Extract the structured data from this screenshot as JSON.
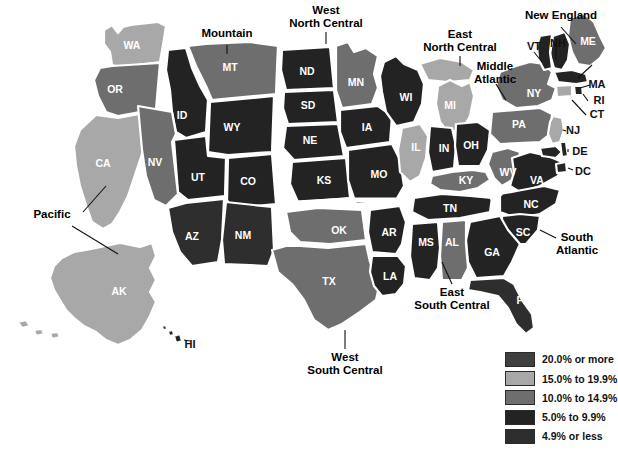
{
  "map": {
    "title": "United States Choropleth Map",
    "background_color": "#ffffff",
    "border_color": "#ffffff"
  },
  "legend": {
    "items": [
      {
        "label": "20.0% or more",
        "color": "#3f3f3f"
      },
      {
        "label": "15.0% to 19.9%",
        "color": "#a8a8a8"
      },
      {
        "label": "10.0% to 14.9%",
        "color": "#6e6e6e"
      },
      {
        "label": "5.0% to 9.9%",
        "color": "#232323"
      },
      {
        "label": "4.9% or less",
        "color": "#2e2e2e"
      }
    ]
  },
  "palette": {
    "c20plus": "#3f3f3f",
    "c15to19": "#a8a8a8",
    "c10to14": "#6e6e6e",
    "c5to9": "#232323",
    "c4orless": "#2e2e2e"
  },
  "region_labels": [
    {
      "id": "pacific",
      "lines": [
        "Pacific"
      ],
      "x": 52,
      "y": 218
    },
    {
      "id": "mountain",
      "lines": [
        "Mountain"
      ],
      "x": 227,
      "y": 37
    },
    {
      "id": "west-north-central",
      "lines": [
        "West",
        "North Central"
      ],
      "x": 326,
      "y": 14
    },
    {
      "id": "east-north-central",
      "lines": [
        "East",
        "North Central"
      ],
      "x": 460,
      "y": 38
    },
    {
      "id": "middle-atlantic",
      "lines": [
        "Middle",
        "Atlantic"
      ],
      "x": 495,
      "y": 70
    },
    {
      "id": "new-england",
      "lines": [
        "New England"
      ],
      "x": 561,
      "y": 19
    },
    {
      "id": "south-atlantic",
      "lines": [
        "South",
        "Atlantic"
      ],
      "x": 577,
      "y": 241
    },
    {
      "id": "east-south-central",
      "lines": [
        "East",
        "South Central"
      ],
      "x": 452,
      "y": 296
    },
    {
      "id": "west-south-central",
      "lines": [
        "West",
        "South Central"
      ],
      "x": 345,
      "y": 361
    }
  ],
  "states": [
    {
      "code": "WA",
      "name": "Washington",
      "bucket": "c15to19",
      "lx": 132,
      "ly": 46
    },
    {
      "code": "OR",
      "name": "Oregon",
      "bucket": "c10to14",
      "lx": 115,
      "ly": 90
    },
    {
      "code": "CA",
      "name": "California",
      "bucket": "c15to19",
      "lx": 103,
      "ly": 164
    },
    {
      "code": "NV",
      "name": "Nevada",
      "bucket": "c10to14",
      "lx": 155,
      "ly": 163
    },
    {
      "code": "ID",
      "name": "Idaho",
      "bucket": "c5to9",
      "lx": 182,
      "ly": 116
    },
    {
      "code": "MT",
      "name": "Montana",
      "bucket": "c10to14",
      "lx": 230,
      "ly": 68
    },
    {
      "code": "WY",
      "name": "Wyoming",
      "bucket": "c5to9",
      "lx": 232,
      "ly": 128
    },
    {
      "code": "UT",
      "name": "Utah",
      "bucket": "c5to9",
      "lx": 198,
      "ly": 178
    },
    {
      "code": "CO",
      "name": "Colorado",
      "bucket": "c5to9",
      "lx": 248,
      "ly": 182
    },
    {
      "code": "AZ",
      "name": "Arizona",
      "bucket": "c4orless",
      "lx": 192,
      "ly": 237
    },
    {
      "code": "NM",
      "name": "New Mexico",
      "bucket": "c4orless",
      "lx": 243,
      "ly": 236
    },
    {
      "code": "ND",
      "name": "North Dakota",
      "bucket": "c5to9",
      "lx": 307,
      "ly": 72
    },
    {
      "code": "SD",
      "name": "South Dakota",
      "bucket": "c5to9",
      "lx": 308,
      "ly": 106
    },
    {
      "code": "NE",
      "name": "Nebraska",
      "bucket": "c5to9",
      "lx": 310,
      "ly": 141
    },
    {
      "code": "KS",
      "name": "Kansas",
      "bucket": "c5to9",
      "lx": 324,
      "ly": 181
    },
    {
      "code": "MN",
      "name": "Minnesota",
      "bucket": "c10to14",
      "lx": 356,
      "ly": 83
    },
    {
      "code": "IA",
      "name": "Iowa",
      "bucket": "c5to9",
      "lx": 367,
      "ly": 128
    },
    {
      "code": "MO",
      "name": "Missouri",
      "bucket": "c5to9",
      "lx": 379,
      "ly": 175
    },
    {
      "code": "WI",
      "name": "Wisconsin",
      "bucket": "c5to9",
      "lx": 406,
      "ly": 98
    },
    {
      "code": "IL",
      "name": "Illinois",
      "bucket": "c15to19",
      "lx": 416,
      "ly": 148
    },
    {
      "code": "MI",
      "name": "Michigan",
      "bucket": "c15to19",
      "lx": 450,
      "ly": 106
    },
    {
      "code": "IN",
      "name": "Indiana",
      "bucket": "c5to9",
      "lx": 444,
      "ly": 149
    },
    {
      "code": "OH",
      "name": "Ohio",
      "bucket": "c5to9",
      "lx": 471,
      "ly": 146
    },
    {
      "code": "KY",
      "name": "Kentucky",
      "bucket": "c10to14",
      "lx": 466,
      "ly": 181
    },
    {
      "code": "TN",
      "name": "Tennessee",
      "bucket": "c5to9",
      "lx": 450,
      "ly": 209
    },
    {
      "code": "OK",
      "name": "Oklahoma",
      "bucket": "c10to14",
      "lx": 339,
      "ly": 231
    },
    {
      "code": "AR",
      "name": "Arkansas",
      "bucket": "c5to9",
      "lx": 389,
      "ly": 233
    },
    {
      "code": "TX",
      "name": "Texas",
      "bucket": "c10to14",
      "lx": 329,
      "ly": 282
    },
    {
      "code": "LA",
      "name": "Louisiana",
      "bucket": "c5to9",
      "lx": 390,
      "ly": 277
    },
    {
      "code": "MS",
      "name": "Mississippi",
      "bucket": "c5to9",
      "lx": 426,
      "ly": 243
    },
    {
      "code": "AL",
      "name": "Alabama",
      "bucket": "c10to14",
      "lx": 452,
      "ly": 243
    },
    {
      "code": "GA",
      "name": "Georgia",
      "bucket": "c5to9",
      "lx": 492,
      "ly": 253
    },
    {
      "code": "SC",
      "name": "South Carolina",
      "bucket": "c5to9",
      "lx": 523,
      "ly": 233
    },
    {
      "code": "NC",
      "name": "North Carolina",
      "bucket": "c5to9",
      "lx": 531,
      "ly": 205
    },
    {
      "code": "FL",
      "name": "Florida",
      "bucket": "c4orless",
      "lx": 523,
      "ly": 301
    },
    {
      "code": "VA",
      "name": "Virginia",
      "bucket": "c5to9",
      "lx": 537,
      "ly": 181
    },
    {
      "code": "WV",
      "name": "West Virginia",
      "bucket": "c10to14",
      "lx": 508,
      "ly": 173
    },
    {
      "code": "PA",
      "name": "Pennsylvania",
      "bucket": "c10to14",
      "lx": 519,
      "ly": 125
    },
    {
      "code": "NY",
      "name": "New York",
      "bucket": "c10to14",
      "lx": 534,
      "ly": 94
    },
    {
      "code": "ME",
      "name": "Maine",
      "bucket": "c10to14",
      "lx": 588,
      "ly": 42
    },
    {
      "code": "VT",
      "name": "Vermont",
      "bucket": "c5to9",
      "lx": 532,
      "ly": 47
    },
    {
      "code": "NH",
      "name": "New Hampshire",
      "bucket": "c5to9",
      "lx": 558,
      "ly": 44
    },
    {
      "code": "MA",
      "name": "Massachusetts",
      "bucket": "c5to9",
      "lx": 597,
      "ly": 85
    },
    {
      "code": "RI",
      "name": "Rhode Island",
      "bucket": "c5to9",
      "lx": 599,
      "ly": 101
    },
    {
      "code": "CT",
      "name": "Connecticut",
      "bucket": "c15to19",
      "lx": 597,
      "ly": 115
    },
    {
      "code": "NJ",
      "name": "New Jersey",
      "bucket": "c15to19",
      "lx": 573,
      "ly": 131
    },
    {
      "code": "DE",
      "name": "Delaware",
      "bucket": "c5to9",
      "lx": 580,
      "ly": 152
    },
    {
      "code": "DC",
      "name": "District of Columbia",
      "bucket": "c5to9",
      "lx": 583,
      "ly": 172
    },
    {
      "code": "AK",
      "name": "Alaska",
      "bucket": "c15to19",
      "lx": 119,
      "ly": 292
    },
    {
      "code": "HI",
      "name": "Hawaii",
      "bucket": "c5to9",
      "lx": 186,
      "ly": 345
    }
  ]
}
